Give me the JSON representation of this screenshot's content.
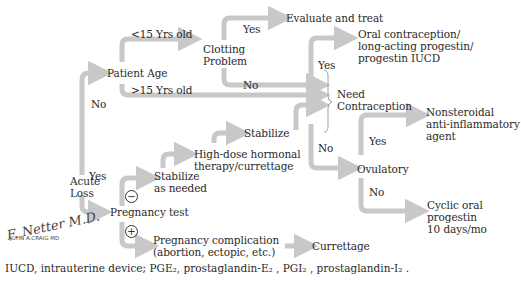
{
  "diagram": {
    "nodes": {
      "acute_loss": "Acute Loss",
      "patient_age": "Patient Age",
      "clotting_problem": "Clotting Problem",
      "evaluate_treat": "Evaluate and treat",
      "need_contraception": "Need Contraception",
      "oral_contraception": [
        "Oral contraception/",
        "long-acting progestin/",
        "progestin IUCD"
      ],
      "ovulatory": "Ovulatory",
      "nsaid": [
        "Nonsteroidal",
        "anti-inflammatory",
        "agent"
      ],
      "cyclic": [
        "Cyclic oral",
        "progestin",
        "10 days/mo"
      ],
      "pregnancy_test": "Pregnancy test",
      "stabilize_as_needed": [
        "Stabilize",
        "as needed"
      ],
      "high_dose": [
        "High-dose hormonal",
        "therapy/currettage"
      ],
      "stabilize": "Stabilize",
      "pregnancy_complication": [
        "Pregnancy complication",
        "(abortion, ectopic, etc.)"
      ],
      "currettage": "Currettage"
    },
    "edges": {
      "lt15": "<15 Yrs old",
      "gt15": ">15 Yrs old",
      "acute_no": "No",
      "acute_yes": "Yes",
      "clot_yes": "Yes",
      "clot_no": "No",
      "contra_yes": "Yes",
      "contra_no": "No",
      "ovul_yes": "Yes",
      "ovul_no": "No",
      "preg_neg": "−",
      "preg_pos": "+"
    },
    "signature": [
      "F. Netter M.D.",
      "JOHN A.CRAIG MD"
    ],
    "caption": "IUCD, intrauterine device; PGE₂, prostaglandin-E₂ , PGI₂ , prostaglandin-I₂ .",
    "colors": {
      "arrow": "#c8c8c8",
      "text": "#2a2a2a"
    }
  }
}
